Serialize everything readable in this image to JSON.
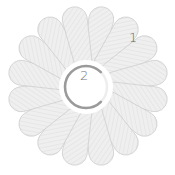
{
  "game": {
    "petal_count": 16,
    "petal_label": "1",
    "center_label": "2",
    "center_progress_ring": {
      "arc_start_deg": 45,
      "arc_sweep_deg": 270
    }
  },
  "colors": {
    "petal_fill": "#efefef",
    "petal_hatch": "#e2e2e2",
    "petal_stroke": "#d0d0d0",
    "ring_track": "#eeeeee",
    "ring_arc": "#9a9a9a",
    "text": "#666666"
  }
}
